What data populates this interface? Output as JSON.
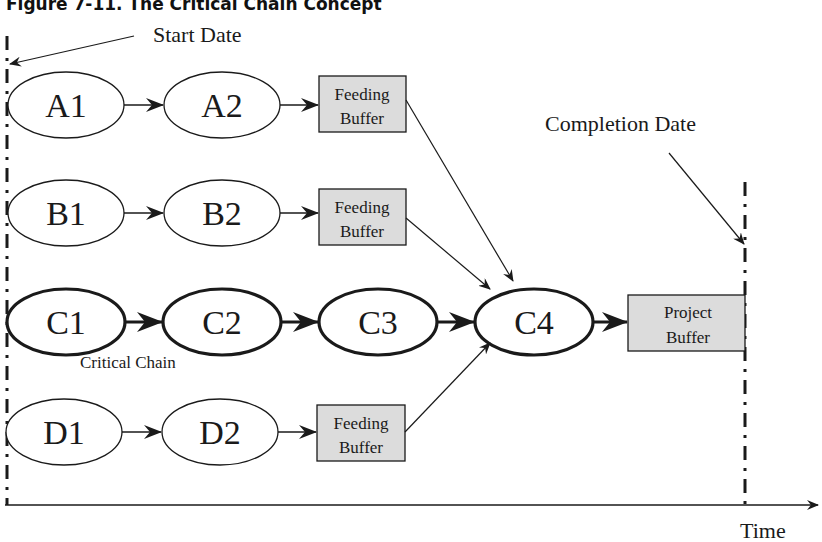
{
  "figure": {
    "title": "Figure 7-11. The Critical Chain Concept",
    "start_date_label": "Start Date",
    "completion_date_label": "Completion Date",
    "time_axis_label": "Time",
    "critical_chain_label": "Critical Chain"
  },
  "colors": {
    "line": "#1a1a1a",
    "buffer_fill": "#dcdcdc",
    "background": "#ffffff"
  },
  "rows": {
    "A": {
      "nodes": [
        "A1",
        "A2"
      ],
      "buffer": [
        "Feeding",
        "Buffer"
      ]
    },
    "B": {
      "nodes": [
        "B1",
        "B2"
      ],
      "buffer": [
        "Feeding",
        "Buffer"
      ]
    },
    "C": {
      "nodes": [
        "C1",
        "C2",
        "C3",
        "C4"
      ],
      "buffer": [
        "Project",
        "Buffer"
      ]
    },
    "D": {
      "nodes": [
        "D1",
        "D2"
      ],
      "buffer": [
        "Feeding",
        "Buffer"
      ]
    }
  }
}
